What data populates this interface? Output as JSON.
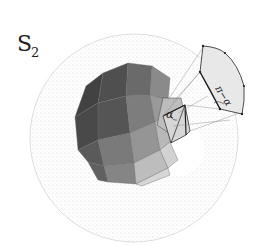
{
  "figure": {
    "sphere_label": "S",
    "sphere_label_subscript": "2",
    "face_angle_label": "α",
    "projected_angle_label": "π−α"
  },
  "colors": {
    "background": "#ffffff",
    "sphere_stipple": "#d4d4d4",
    "sphere_outline": "#e0e0e0",
    "face_darkest": "#4a4a4a",
    "face_dark": "#636363",
    "face_mid": "#858585",
    "face_light": "#a8a8a8",
    "face_lighter": "#c4c4c4",
    "face_lightest": "#dcdcdc",
    "highlight_face": "#d9d9d9",
    "panel_fill": "#e9e9e9",
    "line": "#333333",
    "projection_line": "#8a8a8a"
  }
}
